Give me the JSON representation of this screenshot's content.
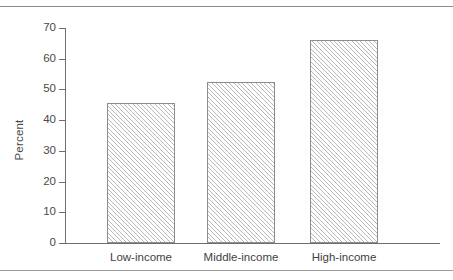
{
  "chart_data": {
    "type": "bar",
    "title": "",
    "xlabel": "",
    "ylabel": "Percent",
    "categories": [
      "Low-income",
      "Middle-income",
      "High-income"
    ],
    "values": [
      45.5,
      52.5,
      66
    ],
    "ylim": [
      0,
      70
    ],
    "ytick_step": 10,
    "yticks": [
      0,
      10,
      20,
      30,
      40,
      50,
      60,
      70
    ],
    "ytick_labels": [
      "0",
      "10",
      "20",
      "30",
      "40",
      "50",
      "60",
      "70"
    ],
    "grid": false,
    "legend": null,
    "series": [
      {
        "name": "Percent",
        "values": [
          45.5,
          52.5,
          66
        ]
      }
    ],
    "bar_fill": "hatched-diagonal",
    "bar_edge_color": "#8d8d8d",
    "axis_color": "#6e6e6e",
    "background_color": "#ffffff",
    "annotations": []
  },
  "figure": {
    "top_rule": "horizontal-rule",
    "bottom_rule": "horizontal-rule"
  }
}
